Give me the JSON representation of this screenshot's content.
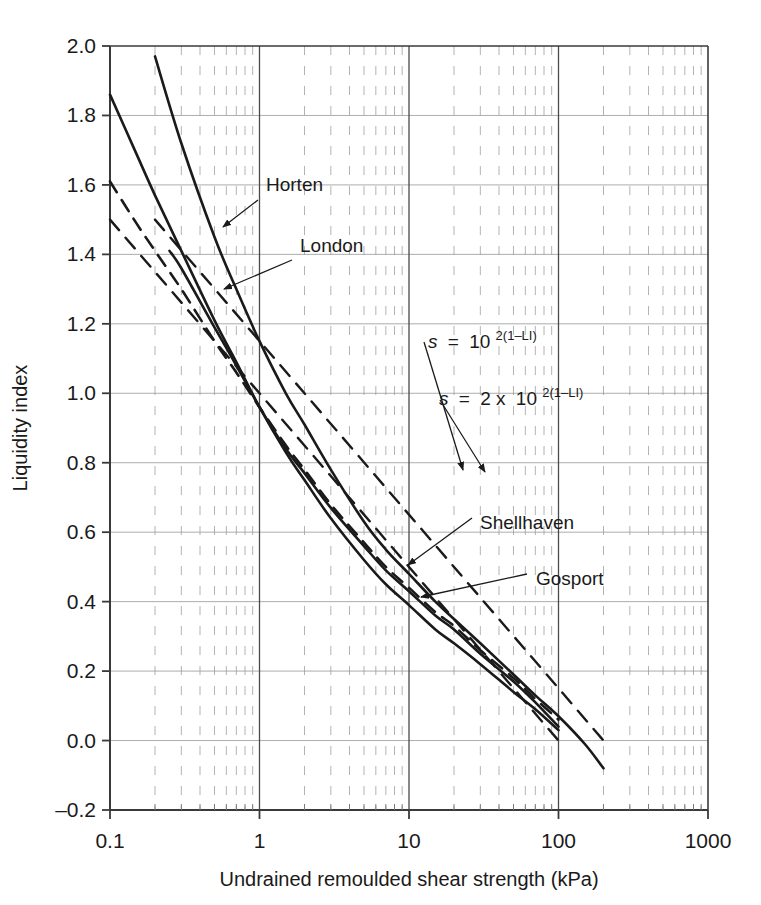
{
  "figure": {
    "background_color": "#ffffff",
    "line_color": "#1a1a1a",
    "grid_color": "#9a9a9a",
    "axis_color": "#3a3a3a"
  },
  "chart_data": {
    "type": "line",
    "title": "",
    "xlabel": "Undrained remoulded shear strength (kPa)",
    "ylabel": "Liquidity index",
    "xscale": "log",
    "xlim": [
      0.1,
      1000
    ],
    "ylim": [
      -0.2,
      2.0
    ],
    "grid": true,
    "legend": "none (inline labelled leader arrows)",
    "xticks": [
      "0.1",
      "1",
      "10",
      "100",
      "1000"
    ],
    "xtick_values": [
      0.1,
      1,
      10,
      100,
      1000
    ],
    "yticks": [
      "-0.2",
      "0.0",
      "0.2",
      "0.4",
      "0.6",
      "0.8",
      "1.0",
      "1.2",
      "1.4",
      "1.6",
      "1.8",
      "2.0"
    ],
    "ytick_values": [
      -0.2,
      0.0,
      0.2,
      0.4,
      0.6,
      0.8,
      1.0,
      1.2,
      1.4,
      1.6,
      1.8,
      2.0
    ],
    "minor_xticks_per_decade": [
      2,
      3,
      4,
      5,
      6,
      7,
      8,
      9
    ],
    "series": [
      {
        "name": "Horten",
        "style": "solid",
        "label_text": "Horten",
        "points": [
          [
            0.2,
            1.97
          ],
          [
            0.3,
            1.72
          ],
          [
            0.5,
            1.45
          ],
          [
            0.7,
            1.3
          ],
          [
            1.0,
            1.15
          ],
          [
            1.5,
            1.0
          ],
          [
            2.0,
            0.91
          ],
          [
            3.0,
            0.78
          ],
          [
            5.0,
            0.63
          ],
          [
            7.0,
            0.55
          ],
          [
            10.0,
            0.48
          ],
          [
            15.0,
            0.4
          ],
          [
            20.0,
            0.35
          ],
          [
            30.0,
            0.28
          ],
          [
            50.0,
            0.19
          ],
          [
            70.0,
            0.13
          ],
          [
            100.0,
            0.07
          ],
          [
            150.0,
            -0.01
          ],
          [
            200.0,
            -0.08
          ]
        ]
      },
      {
        "name": "London",
        "style": "solid",
        "label_text": "London",
        "points": [
          [
            0.1,
            1.86
          ],
          [
            0.15,
            1.69
          ],
          [
            0.2,
            1.57
          ],
          [
            0.3,
            1.41
          ],
          [
            0.5,
            1.21
          ],
          [
            0.7,
            1.09
          ],
          [
            1.0,
            0.96
          ],
          [
            1.5,
            0.83
          ],
          [
            2.0,
            0.75
          ],
          [
            3.0,
            0.64
          ],
          [
            5.0,
            0.52
          ],
          [
            7.0,
            0.45
          ],
          [
            10.0,
            0.39
          ],
          [
            15.0,
            0.32
          ],
          [
            20.0,
            0.28
          ],
          [
            30.0,
            0.22
          ],
          [
            50.0,
            0.14
          ],
          [
            70.0,
            0.09
          ],
          [
            100.0,
            0.03
          ]
        ]
      },
      {
        "name": "Shellhaven",
        "style": "dashed",
        "label_text": "Shellhaven",
        "points": [
          [
            0.1,
            1.61
          ],
          [
            0.15,
            1.49
          ],
          [
            0.2,
            1.41
          ],
          [
            0.3,
            1.3
          ],
          [
            0.5,
            1.15
          ],
          [
            0.7,
            1.06
          ],
          [
            1.0,
            0.96
          ],
          [
            1.5,
            0.85
          ],
          [
            2.0,
            0.78
          ],
          [
            3.0,
            0.68
          ],
          [
            5.0,
            0.57
          ],
          [
            7.0,
            0.5
          ],
          [
            10.0,
            0.44
          ],
          [
            15.0,
            0.37
          ],
          [
            20.0,
            0.33
          ],
          [
            30.0,
            0.26
          ],
          [
            50.0,
            0.18
          ],
          [
            70.0,
            0.12
          ],
          [
            100.0,
            0.06
          ]
        ]
      },
      {
        "name": "Gosport",
        "style": "solid",
        "label_text": "Gosport",
        "points": [
          [
            0.25,
            1.41
          ],
          [
            0.3,
            1.36
          ],
          [
            0.5,
            1.19
          ],
          [
            0.7,
            1.08
          ],
          [
            1.0,
            0.96
          ],
          [
            1.5,
            0.84
          ],
          [
            2.0,
            0.77
          ],
          [
            3.0,
            0.67
          ],
          [
            5.0,
            0.56
          ],
          [
            7.0,
            0.49
          ],
          [
            10.0,
            0.43
          ],
          [
            15.0,
            0.36
          ],
          [
            20.0,
            0.32
          ],
          [
            30.0,
            0.25
          ],
          [
            50.0,
            0.17
          ],
          [
            70.0,
            0.11
          ],
          [
            100.0,
            0.04
          ]
        ]
      },
      {
        "name": "s = 10^2(1-LI)",
        "style": "dashed",
        "label_text": "s = 10²⁽¹⁻ᴸᴵ⁾",
        "is_equation_line": true,
        "points": [
          [
            0.1,
            1.5
          ],
          [
            1.0,
            1.0
          ],
          [
            10.0,
            0.5
          ],
          [
            100.0,
            0.0
          ]
        ]
      },
      {
        "name": "s = 2 x 10^2(1-LI)",
        "style": "dashed",
        "label_text": "s = 2 x 10²⁽¹⁻ᴸᴵ⁾",
        "is_equation_line": true,
        "points": [
          [
            0.2,
            1.5
          ],
          [
            2.0,
            1.0
          ],
          [
            20.0,
            0.5
          ],
          [
            200.0,
            0.0
          ]
        ]
      }
    ]
  },
  "annotations": {
    "horten": "Horten",
    "london": "London",
    "shellhaven": "Shellhaven",
    "gosport": "Gosport",
    "eq1": {
      "lhs": "s",
      "eq": "=",
      "base": "10",
      "exponent": "2(1–LI)"
    },
    "eq2": {
      "lhs": "s",
      "eq": "=",
      "coeff": "2 x",
      "base": "10",
      "exponent": "2(1–LI)"
    }
  },
  "axes": {
    "x_title": "Undrained remoulded shear strength (kPa)",
    "y_title": "Liquidity index",
    "x_labels": [
      "0.1",
      "1",
      "10",
      "100",
      "1000"
    ],
    "y_labels": [
      "2.0",
      "1.8",
      "1.6",
      "1.4",
      "1.2",
      "1.0",
      "0.8",
      "0.6",
      "0.4",
      "0.2",
      "0.0",
      "–0.2"
    ]
  }
}
